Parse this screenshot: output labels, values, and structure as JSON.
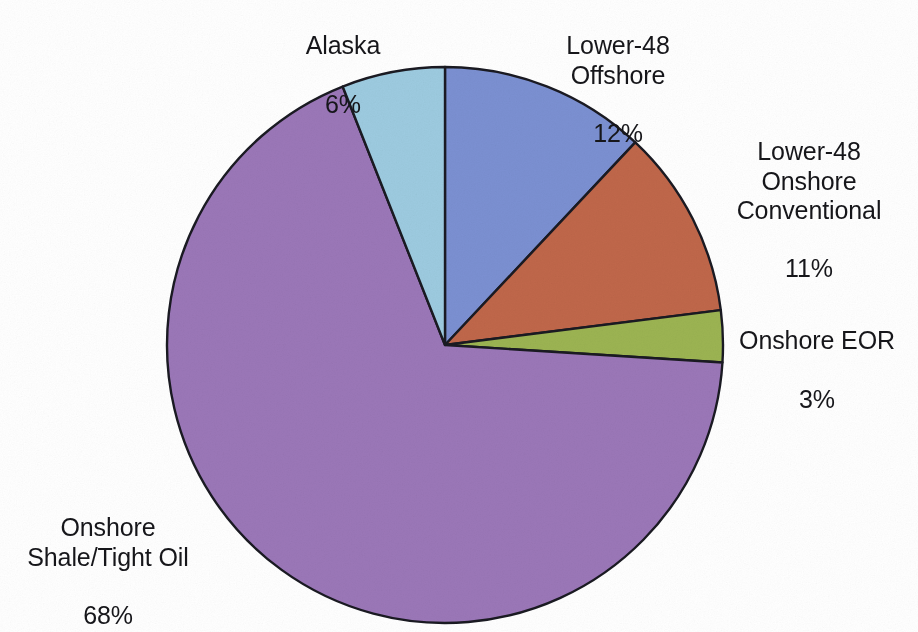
{
  "figure": {
    "background_color": "#ffffff",
    "outline_color": "#1a1a22"
  },
  "chart_data": {
    "type": "pie",
    "title": "",
    "subtitle": "",
    "xlabel": "",
    "ylabel": "",
    "legend_position": "none",
    "grid": false,
    "units": "percent",
    "start_angle_deg": 90,
    "direction": "clockwise",
    "labels": [
      "Lower-48\nOffshore",
      "Lower-48\nOnshore\nConventional",
      "Onshore EOR",
      "Onshore\nShale/Tight Oil",
      "Alaska"
    ],
    "values": [
      12,
      11,
      3,
      68,
      6
    ],
    "value_labels": [
      "12%",
      "11%",
      "3%",
      "68%",
      "6%"
    ],
    "colors": [
      "#7b90d2",
      "#c0674a",
      "#9cb452",
      "#9b77b8",
      "#9dcbe0"
    ],
    "slices": [
      {
        "name": "Lower-48 Offshore",
        "label_lines": [
          "Lower-48",
          "Offshore"
        ],
        "value": 12,
        "value_label": "12%",
        "color": "#7b90d2"
      },
      {
        "name": "Lower-48 Onshore Conventional",
        "label_lines": [
          "Lower-48",
          "Onshore",
          "Conventional"
        ],
        "value": 11,
        "value_label": "11%",
        "color": "#c0674a"
      },
      {
        "name": "Onshore EOR",
        "label_lines": [
          "Onshore EOR"
        ],
        "value": 3,
        "value_label": "3%",
        "color": "#9cb452"
      },
      {
        "name": "Onshore Shale/Tight Oil",
        "label_lines": [
          "Onshore",
          "Shale/Tight Oil"
        ],
        "value": 68,
        "value_label": "68%",
        "color": "#9b77b8"
      },
      {
        "name": "Alaska",
        "label_lines": [
          "Alaska"
        ],
        "value": 6,
        "value_label": "6%",
        "color": "#9dcbe0"
      }
    ]
  },
  "labels": {
    "alaska": {
      "name": "Alaska",
      "pct": "6%"
    },
    "offshore": {
      "name": "Lower-48\nOffshore",
      "pct": "12%"
    },
    "conventional": {
      "name": "Lower-48\nOnshore\nConventional",
      "pct": "11%"
    },
    "eor": {
      "name": "Onshore EOR",
      "pct": "3%"
    },
    "shale": {
      "name": "Onshore\nShale/Tight Oil",
      "pct": "68%"
    }
  }
}
